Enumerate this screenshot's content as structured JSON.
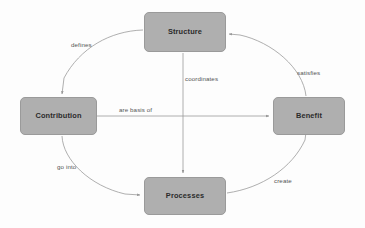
{
  "diagram": {
    "type": "cycle-diagram",
    "background_color": "#fdfdfd",
    "node_fill_color": "#afafaf",
    "node_border_color": "#9a9a9a",
    "edge_color": "#9b9b9b",
    "label_color": "#555555",
    "node_text_color": "#2b2b2b",
    "nodes": [
      {
        "id": "structure",
        "label": "Structure",
        "x": 144,
        "y": 12,
        "w": 82,
        "h": 40
      },
      {
        "id": "contribution",
        "label": "Contribution",
        "x": 20,
        "y": 97,
        "w": 77,
        "h": 38
      },
      {
        "id": "benefit",
        "label": "Benefit",
        "x": 273,
        "y": 97,
        "w": 72,
        "h": 38
      },
      {
        "id": "processes",
        "label": "Processes",
        "x": 144,
        "y": 177,
        "w": 82,
        "h": 38
      }
    ],
    "edges": [
      {
        "id": "defines",
        "label": "defines",
        "from": "structure",
        "to": "contribution",
        "shape": "arc",
        "label_x": 71,
        "label_y": 42
      },
      {
        "id": "go-into",
        "label": "go into",
        "from": "contribution",
        "to": "processes",
        "shape": "arc",
        "label_x": 57,
        "label_y": 164
      },
      {
        "id": "create",
        "label": "create",
        "from": "processes",
        "to": "benefit",
        "shape": "arc",
        "label_x": 274,
        "label_y": 178
      },
      {
        "id": "satisfies",
        "label": "satisfies",
        "from": "benefit",
        "to": "structure",
        "shape": "arc",
        "label_x": 297,
        "label_y": 70
      },
      {
        "id": "are-basis-of",
        "label": "are basis of",
        "from": "contribution",
        "to": "benefit",
        "shape": "horizontal",
        "label_x": 119,
        "label_y": 107
      },
      {
        "id": "coordinates",
        "label": "coordinates",
        "from": "structure",
        "to": "processes",
        "shape": "vertical",
        "label_x": 185,
        "label_y": 76
      }
    ]
  }
}
